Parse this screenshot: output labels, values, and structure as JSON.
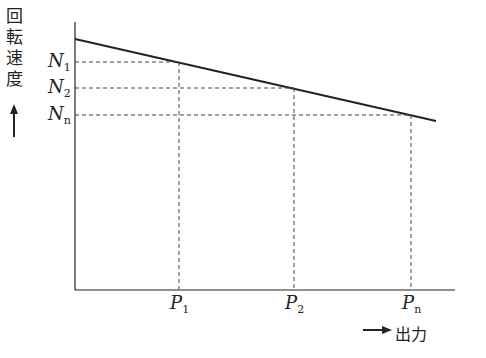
{
  "diagram": {
    "type": "line-diagram",
    "y_axis_label_chars": [
      "回",
      "転",
      "速",
      "度"
    ],
    "y_axis_arrow": "up-arrow",
    "x_axis_label": "出力",
    "x_axis_arrow": "right-arrow",
    "y_ticks": [
      {
        "main": "N",
        "sub": "1"
      },
      {
        "main": "N",
        "sub": "2"
      },
      {
        "main": "N",
        "sub": "n"
      }
    ],
    "x_ticks": [
      {
        "main": "P",
        "sub": "1"
      },
      {
        "main": "P",
        "sub": "2"
      },
      {
        "main": "P",
        "sub": "n"
      }
    ],
    "colors": {
      "line": "#222222",
      "dashed": "#444444"
    }
  }
}
